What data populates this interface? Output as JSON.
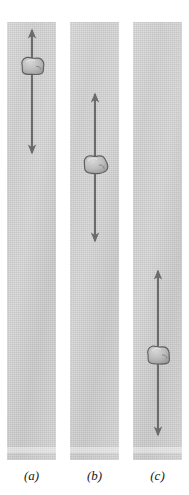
{
  "figure": {
    "type": "diagram",
    "background_color": "#ffffff",
    "column_color": "#d4d4d4",
    "arrow_color": "#6b6b6b",
    "rock_fill_color": "#b7b7b7",
    "rock_outline_color": "#5f5f5f",
    "label_color": "#1a1a1a"
  },
  "panels": [
    {
      "id": "a",
      "label": "(a)",
      "column": {
        "x": 7,
        "y": 22,
        "width": 49,
        "height": 438
      },
      "arrow": {
        "center_x": 32,
        "top_y": 30,
        "bottom_y": 153,
        "double_headed": true,
        "length": 123
      },
      "rock": {
        "center_x": 32,
        "center_y": 66,
        "width": 23,
        "height": 17,
        "position_along_arrow": "near-top"
      }
    },
    {
      "id": "b",
      "label": "(b)",
      "column": {
        "x": 70,
        "y": 22,
        "width": 49,
        "height": 438
      },
      "arrow": {
        "center_x": 95,
        "top_y": 94,
        "bottom_y": 241,
        "double_headed": true,
        "length": 147
      },
      "rock": {
        "center_x": 95,
        "center_y": 165,
        "width": 25,
        "height": 18,
        "position_along_arrow": "upper-middle"
      }
    },
    {
      "id": "c",
      "label": "(c)",
      "column": {
        "x": 133,
        "y": 22,
        "width": 49,
        "height": 438
      },
      "arrow": {
        "center_x": 158,
        "top_y": 271,
        "bottom_y": 435,
        "double_headed": true,
        "length": 164
      },
      "rock": {
        "center_x": 158,
        "center_y": 355,
        "width": 24,
        "height": 18,
        "position_along_arrow": "middle"
      }
    }
  ]
}
